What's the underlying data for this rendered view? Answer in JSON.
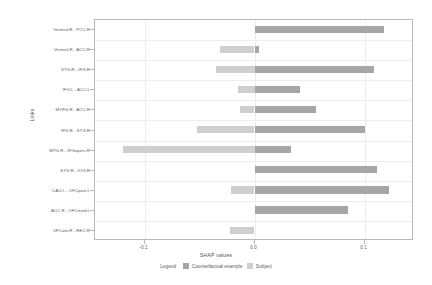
{
  "chart_data": {
    "type": "bar",
    "orientation": "horizontal",
    "title": "",
    "xlabel": "SHAP values",
    "ylabel": "Links",
    "xlim": [
      -0.145,
      0.145
    ],
    "xticks": [
      -0.1,
      0.0,
      0.1
    ],
    "xtick_labels": [
      "-0.1",
      "0.0",
      "0.1"
    ],
    "grid": true,
    "legend_position": "bottom",
    "legend_title": "Legend",
    "categories": [
      "VermisLR - PCC.R",
      "VermisLR - ACC.R",
      "STG.R - IFG.R",
      "IFG.L - ACC.L",
      "MVFG.R - ACC.R",
      "IFG.R - STG.R",
      "MTG.R - IFGoperc.R",
      "STG.R - IOG.R",
      "CAU.L - OFCpost.L",
      "ACC.R - OFCmed.L",
      "OFCant.R - REC.R"
    ],
    "series": [
      {
        "name": "Subject",
        "color": "#cfcfcf",
        "values": [
          0.0,
          -0.031,
          -0.035,
          -0.015,
          -0.013,
          -0.052,
          -0.12,
          0.0,
          -0.021,
          0.0,
          -0.022
        ]
      },
      {
        "name": "Counterfactual example",
        "color": "#a6a6a6",
        "values": [
          0.118,
          0.004,
          0.109,
          0.041,
          0.056,
          0.1,
          0.033,
          0.111,
          0.122,
          0.085,
          0.0
        ]
      }
    ]
  },
  "legend": {
    "title": "Legend",
    "entries": [
      {
        "label": "Counterfactual example",
        "color": "#a6a6a6"
      },
      {
        "label": "Subject",
        "color": "#cfcfcf"
      }
    ]
  }
}
